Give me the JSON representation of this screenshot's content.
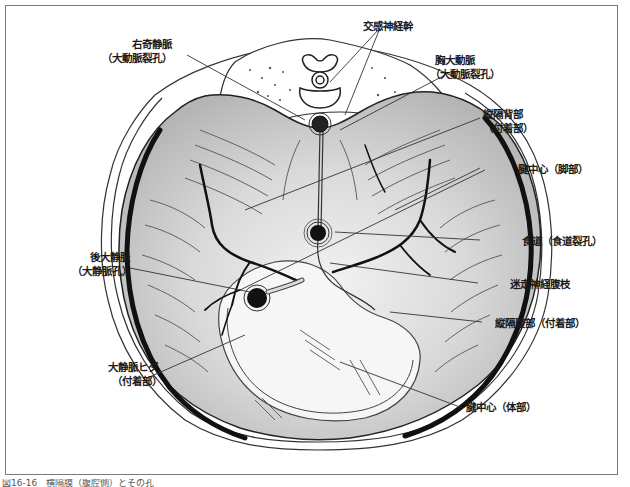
{
  "figure": {
    "caption": "図16-16　横隔膜（腹腔側）とその孔"
  },
  "labels": {
    "azygos": {
      "line1": "右奇静脈",
      "line2": "（大動脈裂孔）"
    },
    "sympathetic_trunk": {
      "line1": "交感神経幹"
    },
    "thoracic_aorta": {
      "line1": "胸大動脈",
      "line2": "（大動脈裂孔）"
    },
    "dorsal_mediastinum": {
      "line1": "縦隔背部",
      "line2": "（付着部）"
    },
    "central_tendon_crus": {
      "line1": "腱中心（脚部）"
    },
    "esophagus": {
      "line1": "食道（食道裂孔）"
    },
    "vagus_celiac": {
      "line1": "迷走神経腹枝"
    },
    "ventral_mediastinum": {
      "line1": "縦隔腹部（付着部）"
    },
    "caudal_vena_cava": {
      "line1": "後大静脈",
      "line2": "（大静脈孔）"
    },
    "vena_cava_fold": {
      "line1": "大静脈ヒダ",
      "line2": "（付着部）"
    },
    "central_tendon_body": {
      "line1": "腱中心（体部）"
    }
  },
  "colors": {
    "ink": "#1a1a1a",
    "muscle_shade": "#c8c8c8",
    "tendon": "#f4f4f4",
    "frame": "#7a7a7a"
  }
}
